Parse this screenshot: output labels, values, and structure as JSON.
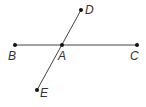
{
  "diagram": {
    "type": "geometry-lines",
    "colors": {
      "line": "#444444",
      "point": "#111111",
      "label": "#333333"
    },
    "points": [
      {
        "id": "B",
        "label": "B",
        "x": 15,
        "y": 45,
        "lx": 8,
        "ly": 60
      },
      {
        "id": "A",
        "label": "A",
        "x": 62,
        "y": 45,
        "lx": 58,
        "ly": 60
      },
      {
        "id": "C",
        "label": "C",
        "x": 137,
        "y": 45,
        "lx": 130,
        "ly": 60
      },
      {
        "id": "D",
        "label": "D",
        "x": 81,
        "y": 10,
        "lx": 85,
        "ly": 14
      },
      {
        "id": "E",
        "label": "E",
        "x": 37,
        "y": 90,
        "lx": 40,
        "ly": 97
      }
    ],
    "segments": [
      {
        "from": "B",
        "to": "C"
      },
      {
        "from": "D",
        "to": "E"
      }
    ]
  }
}
